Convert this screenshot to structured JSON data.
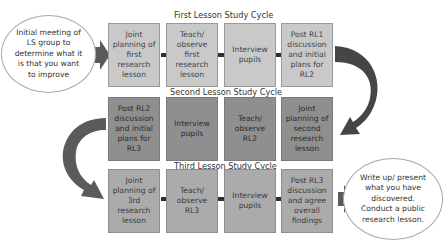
{
  "diagram": {
    "start_node": {
      "text": "Initial meeting of LS group to determine what it is that you want to improve"
    },
    "end_node": {
      "text": "Write up/ present what you have discovered. Conduct a public research lesson."
    },
    "cycles": [
      {
        "title": "First Lesson Study Cycle",
        "direction": "left-to-right",
        "steps": [
          {
            "text": "Joint planning of first research lesson"
          },
          {
            "text": "Teach/ observe first research lesson"
          },
          {
            "text": "Interview pupils"
          },
          {
            "text": "Post RL1 discussion and initial plans for RL2"
          }
        ]
      },
      {
        "title": "Second Lesson Study Cycle",
        "direction": "right-to-left",
        "steps": [
          {
            "text": "Joint planning of second research lesson"
          },
          {
            "text": "Teach/ observe RL2"
          },
          {
            "text": "Interview pupils"
          },
          {
            "text": "Post RL2 discussion and initial plans for RL3"
          }
        ]
      },
      {
        "title": "Third Lesson Study Cycle",
        "direction": "left-to-right",
        "steps": [
          {
            "text": "Joint planning of 3rd research lesson"
          },
          {
            "text": "Teach/ observe RL3"
          },
          {
            "text": "Interview pupils"
          },
          {
            "text": "Post RL3 discussion and agree overall findings"
          }
        ]
      }
    ],
    "colors": {
      "cycle1_fill": "#c9c9c9",
      "cycle2_fill": "#8f8f8f",
      "cycle3_fill": "#ababab",
      "arrow": "#3a3a3a",
      "curved_arrow": "#444444"
    }
  }
}
